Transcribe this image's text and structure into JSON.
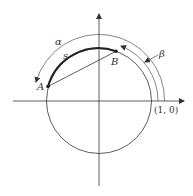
{
  "diagram": {
    "type": "unit-circle-arcs",
    "labels": {
      "alpha": "α",
      "beta": "β",
      "s": "s",
      "point_a": "A",
      "point_b": "B",
      "unit_point": "(1, 0)"
    },
    "colors": {
      "stroke": "#333333",
      "background": "#ffffff"
    }
  }
}
